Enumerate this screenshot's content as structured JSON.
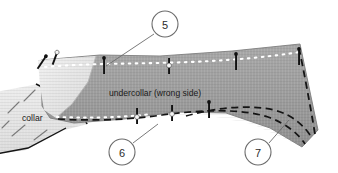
{
  "figure": {
    "labels": [
      {
        "id": "undercollar-label",
        "text": "undercollar (wrong side)",
        "x": 109,
        "y": 96
      },
      {
        "id": "collar-label",
        "text": "collar",
        "x": 22,
        "y": 121
      }
    ],
    "callouts": [
      {
        "id": "callout-5",
        "number": "5",
        "cx": 165,
        "cy": 24,
        "r": 13
      },
      {
        "id": "callout-6",
        "number": "6",
        "cx": 122,
        "cy": 152,
        "r": 13
      },
      {
        "id": "callout-7",
        "number": "7",
        "cx": 258,
        "cy": 152,
        "r": 13
      }
    ],
    "leaders": [
      {
        "id": "leader-5",
        "d": "M 154 34 L 106 66"
      },
      {
        "id": "leader-6",
        "d": "M 133 143 L 157 124"
      },
      {
        "id": "leader-7",
        "d": "M 269 143 L 288 120"
      }
    ],
    "colors": {
      "undercollar_fill": "#9c9c9c",
      "undercollar_fill_light": "#aeaeae",
      "collar_fill": "#e3e3e3",
      "highlight_fill": "#e9e9e9",
      "outline": "#6f6f6f",
      "dark_outline": "#1a1a1a",
      "stitch_white": "#ffffff",
      "stitch_dark": "#141414",
      "callout_stroke": "#6b6b6b",
      "text": "#1a1a1a",
      "background": "#ffffff"
    },
    "shapes": {
      "undercollar_path": "M 41 60 L 100 55 L 160 56 L 232 51 L 300 44 L 318 130 L 300 146 L 252 124 L 200 114 L 150 118 L 100 122 L 62 122 L 44 110 Z",
      "collar_path": "M 0 96 L 36 86 L 78 104 L 86 122 L 66 128 L 28 148 L 2 150 Z",
      "highlight_path": "M 36 60 L 96 56 L 84 104 L 60 120 L 42 110 Z"
    },
    "stitch_lines": {
      "top_white_dots": "M 44 66 L 104 62 L 170 63 L 240 58 L 300 52",
      "bottom_white_dots": "M 58 116 L 110 116 L 152 112",
      "bottom_dark_dashes": "M 58 117 L 120 118 L 172 113 L 222 110 L 268 117 L 300 136",
      "inner_dark_dashes": "M 188 114 L 236 104 L 280 108 L 306 132",
      "right_dark_dashes": "M 298 48 L 310 92 L 316 128"
    },
    "pins": [
      {
        "id": "pin-1",
        "x": 41,
        "y": 62,
        "angle": 30,
        "head": "dark"
      },
      {
        "id": "pin-2",
        "x": 54,
        "y": 59,
        "angle": 18,
        "head": "light"
      },
      {
        "id": "pin-3",
        "x": 103,
        "y": 65,
        "angle": 0,
        "head": "dark"
      },
      {
        "id": "pin-4",
        "x": 168,
        "y": 66,
        "angle": 0,
        "head": "light"
      },
      {
        "id": "pin-5",
        "x": 236,
        "y": 61,
        "angle": 0,
        "head": "dark"
      },
      {
        "id": "pin-6",
        "x": 137,
        "y": 116,
        "angle": 0,
        "head": "light"
      },
      {
        "id": "pin-7",
        "x": 171,
        "y": 113,
        "angle": 0,
        "head": "light"
      },
      {
        "id": "pin-8",
        "x": 209,
        "y": 110,
        "angle": 0,
        "head": "dark"
      },
      {
        "id": "pin-9",
        "x": 299,
        "y": 57,
        "angle": 0,
        "head": "dark"
      }
    ],
    "collar_fold_dashes": [
      "M 22 104 L 34 92",
      "M 10 114 L 22 102",
      "M 16 134 L 30 122",
      "M 34 138 L 46 128"
    ]
  }
}
